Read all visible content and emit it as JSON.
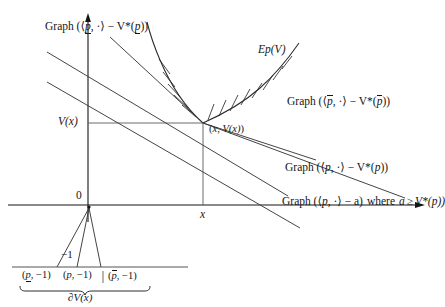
{
  "figure": {
    "kind": "convex-analysis-diagram",
    "colors": {
      "ink": "#151515",
      "line": "#3a3a3a",
      "curve": "#2b2b2b",
      "background": "#ffffff"
    }
  },
  "axes": {
    "origin_label": "0",
    "x_tick_label": "x",
    "y_value_label": "V(x)",
    "minus_one_label": "−1"
  },
  "labels": {
    "graph_p_lower": {
      "prefix": "Graph (⟨",
      "sym": "p",
      "mark": "under",
      "mid": ", ·⟩ − V*(",
      "sym2": "p",
      "suffix": "))"
    },
    "epigraph": {
      "text": "Ep(V)",
      "head": "Ep",
      "arg": "(V)"
    },
    "graph_p_upper": {
      "prefix": "Graph (⟨",
      "sym": "p",
      "mark": "over",
      "mid": ", ·⟩ − V*(",
      "sym2": "p",
      "suffix": "))"
    },
    "graph_p_plain": {
      "prefix": "Graph (⟨",
      "sym": "p",
      "mark": "none",
      "mid": ", ·⟩ − V*(",
      "sym2": "p",
      "suffix": "))"
    },
    "graph_p_a": {
      "prefix": "Graph (⟨",
      "sym": "p",
      "mid": ", ·⟩ − a)",
      "where": "where",
      "cond_a": "a",
      "cond_rel": "≥",
      "cond_rhs": "V*(p))"
    },
    "kink_point": {
      "text": "(x, V(x))",
      "open": "(",
      "x": "x",
      "comma": ", ",
      "v": "V(x)",
      "close": ")"
    },
    "subdiff": {
      "text": "∂V(x)",
      "partial": "∂",
      "v": "V(x)"
    },
    "vectors": [
      {
        "open": "(",
        "sym": "p",
        "mark": "under",
        "rest": ", −1)"
      },
      {
        "open": "(",
        "sym": "p",
        "mark": "none",
        "rest": ", −1)"
      },
      {
        "open": "(",
        "sym": "p",
        "mark": "over",
        "rest": ", −1)"
      }
    ]
  },
  "geometry": {
    "x_axis_y": 205,
    "y_axis_x": 88,
    "kink": {
      "x": 203,
      "y": 123
    },
    "x_tick": 203,
    "minus_one_line_y": 267,
    "vertical_axis_top": 14,
    "x_axis_right": 420
  }
}
